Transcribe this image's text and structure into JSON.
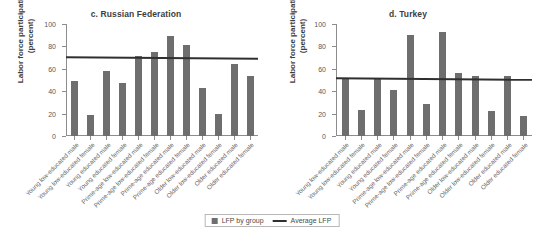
{
  "figure": {
    "categories": [
      "Young low-educated male",
      "Young low-educated female",
      "Young educated male",
      "Young educated female",
      "Prime-age low-educated male",
      "Prime-age low-educated female",
      "Prime-age educated male",
      "Prime-age educated female",
      "Older low-educated male",
      "Older low-educated female",
      "Older educated male",
      "Older educated female"
    ],
    "legend": {
      "bars_label": "LFP by group",
      "line_label": "Average LFP",
      "bar_swatch_icon": "filled-square-icon",
      "line_swatch_icon": "horizontal-line-icon"
    },
    "axis": {
      "ylabel": "Labor force participation (percent)",
      "yticks": [
        "100",
        "80",
        "60",
        "40",
        "20",
        "0"
      ],
      "ymin": 0,
      "ymax": 100
    },
    "colors": {
      "bar": "#6e6e6e",
      "average_line": "#2f2f2f",
      "axis": "#8d8d8d",
      "text": "#3d3d3d"
    }
  },
  "chart_data": [
    {
      "type": "bar",
      "panel": "c",
      "title": "c. Russian Federation",
      "xlabel": "",
      "ylabel": "Labor force participation (percent)",
      "ylim": [
        0,
        100
      ],
      "yticks": [
        0,
        20,
        40,
        60,
        80,
        100
      ],
      "grid": false,
      "legend_position": "bottom-center",
      "categories": [
        "Young low-educated male",
        "Young low-educated female",
        "Young educated male",
        "Young educated female",
        "Prime-age low-educated male",
        "Prime-age low-educated female",
        "Prime-age educated male",
        "Prime-age educated female",
        "Older low-educated male",
        "Older low-educated female",
        "Older educated male",
        "Older educated female"
      ],
      "series": [
        {
          "name": "LFP by group",
          "values": [
            49,
            19,
            58,
            47,
            71,
            75,
            89,
            81,
            43,
            20,
            64,
            54
          ]
        }
      ],
      "reference_line": {
        "name": "Average LFP",
        "value": 71,
        "value_left": 71.5,
        "value_right": 70.0
      }
    },
    {
      "type": "bar",
      "panel": "d",
      "title": "d. Turkey",
      "xlabel": "",
      "ylabel": "Labor force participation (percent)",
      "ylim": [
        0,
        100
      ],
      "yticks": [
        0,
        20,
        40,
        60,
        80,
        100
      ],
      "grid": false,
      "legend_position": "bottom-center",
      "categories": [
        "Young low-educated male",
        "Young low-educated female",
        "Young educated male",
        "Young educated female",
        "Prime-age low-educated male",
        "Prime-age low-educated female",
        "Prime-age educated male",
        "Prime-age educated female",
        "Older low-educated male",
        "Older low-educated female",
        "Older educated male",
        "Older educated female"
      ],
      "series": [
        {
          "name": "LFP by group",
          "values": [
            52,
            23,
            52,
            41,
            90,
            29,
            93,
            56,
            54,
            22,
            54,
            18
          ]
        }
      ],
      "reference_line": {
        "name": "Average LFP",
        "value": 52,
        "value_left": 52.5,
        "value_right": 51.0
      }
    }
  ]
}
